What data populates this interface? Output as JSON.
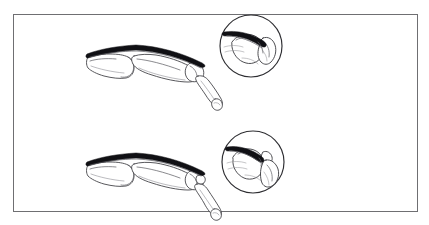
{
  "figure": {
    "title": "Mallet finger extensor tendon injury diagram",
    "caption": "",
    "width": 429,
    "height": 225,
    "background_color": "#ffffff"
  },
  "frame": {
    "name": "figure-border",
    "x": 13,
    "y": 14,
    "width": 405,
    "height": 198,
    "stroke_color": "#6f6f72",
    "stroke_width": 1,
    "fill_color": "#ffffff"
  },
  "colors": {
    "outline": "#3a3a3e",
    "detail": "#58585d",
    "faint": "#8d8d93",
    "tendon": "#101014",
    "circle_rim": "#2d2d31",
    "paper": "#ffffff"
  },
  "panels": [
    {
      "id": "panel-top",
      "label": "",
      "finger": {
        "name": "finger-lateral-view-top",
        "description": "Lateral view of finger skeleton with dark extensor tendon band along the dorsal surface and drooping distal phalanx",
        "origin_x": 85,
        "origin_y": 44
      },
      "inset": {
        "name": "magnified-inset-top",
        "description": "Circular magnification of the distal interphalangeal joint showing the tendon attachment",
        "center_x": 251,
        "center_y": 46,
        "radius": 31
      }
    },
    {
      "id": "panel-bottom",
      "label": "",
      "finger": {
        "name": "finger-lateral-view-bottom",
        "description": "Lateral view of finger skeleton with dark extensor tendon band and avulsed distal phalanx",
        "origin_x": 85,
        "origin_y": 152
      },
      "inset": {
        "name": "magnified-inset-bottom",
        "description": "Circular magnification of the distal interphalangeal joint showing tendon rupture with bone fragment",
        "center_x": 253,
        "center_y": 162,
        "radius": 31
      }
    }
  ],
  "annotations": {
    "leaders": [],
    "labels": []
  }
}
